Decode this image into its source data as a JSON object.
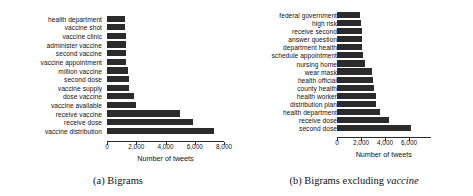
{
  "figure": {
    "panels": [
      {
        "id": "panel-a",
        "caption_prefix": "(a)",
        "caption_text": "Bigrams",
        "caption_emphasis": ""
      },
      {
        "id": "panel-b",
        "caption_prefix": "(b)",
        "caption_text": "Bigrams excluding",
        "caption_emphasis": "vaccine"
      }
    ]
  },
  "chart_data": [
    {
      "type": "bar",
      "orientation": "horizontal",
      "title": "(a) Bigrams",
      "xlabel": "Number of tweets",
      "ylabel": "",
      "xlim": [
        0,
        8000
      ],
      "xticks": [
        0,
        2000,
        4000,
        6000,
        8000
      ],
      "xticklabels": [
        "0",
        "2,000",
        "4,000",
        "6,000",
        "8,000"
      ],
      "grid": false,
      "legend": null,
      "bar_color": "#2b2b2b",
      "categories": [
        "health department",
        "vaccine shot",
        "vaccine clinic",
        "administer vaccine",
        "second vaccine",
        "vaccine appointment",
        "million vaccine",
        "second dose",
        "vaccine supply",
        "dose vaccine",
        "vaccine available",
        "receive vaccine",
        "receive dose",
        "vaccine distribution"
      ],
      "values": [
        1250,
        1250,
        1280,
        1300,
        1320,
        1330,
        1450,
        1500,
        1520,
        1850,
        1950,
        5000,
        5850,
        7350
      ]
    },
    {
      "type": "bar",
      "orientation": "horizontal",
      "title": "(b) Bigrams excluding vaccine",
      "xlabel": "Number of tweets",
      "ylabel": "",
      "xlim": [
        0,
        7800
      ],
      "xticks": [
        0,
        2000,
        4000,
        6000
      ],
      "xticklabels": [
        "0",
        "2,000",
        "4,000",
        "6,000"
      ],
      "grid": false,
      "legend": null,
      "bar_color": "#2b2b2b",
      "categories": [
        "federal government",
        "high risk",
        "receive second",
        "answer question",
        "department health",
        "schedule appointment",
        "nursing home",
        "wear mask",
        "health official",
        "county health",
        "health worker",
        "distribution plan",
        "health department",
        "receive dose",
        "second dose"
      ],
      "values": [
        1950,
        1980,
        2050,
        2080,
        2100,
        2200,
        2300,
        2950,
        3000,
        3050,
        3250,
        3280,
        3600,
        4350,
        6200
      ]
    }
  ]
}
